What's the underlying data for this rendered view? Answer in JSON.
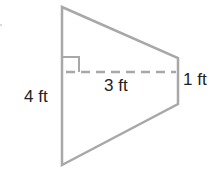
{
  "diagram": {
    "shape": "trapezoid",
    "stroke_color": "#a8a8a8",
    "labels": {
      "left_side": "4 ft",
      "height": "3 ft",
      "right_side": "1 ft"
    },
    "right_angle_marker": true
  }
}
